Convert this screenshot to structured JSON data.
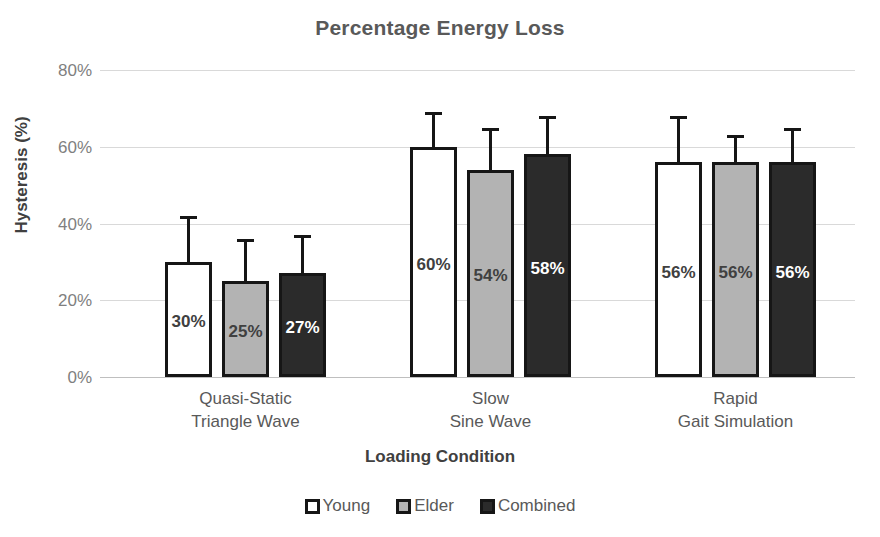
{
  "chart_data": {
    "type": "bar",
    "title": "Percentage Energy Loss",
    "xlabel": "Loading Condition",
    "ylabel": "Hysteresis (%)",
    "ylim": [
      0,
      80
    ],
    "ytick_labels": [
      "80%",
      "60%",
      "40%",
      "20%",
      "0%"
    ],
    "ytick_values": [
      80,
      60,
      40,
      20,
      0
    ],
    "grid": true,
    "legend_position": "bottom",
    "categories": [
      "Quasi-Static\nTriangle Wave",
      "Slow\nSine Wave",
      "Rapid\nGait Simulation"
    ],
    "category_lines": [
      [
        "Quasi-Static",
        "Triangle Wave"
      ],
      [
        "Slow",
        "Sine Wave"
      ],
      [
        "Rapid",
        "Gait Simulation"
      ]
    ],
    "series": [
      {
        "name": "Young",
        "color": "#ffffff",
        "values": [
          30,
          60,
          56
        ],
        "errors": [
          12,
          9,
          12
        ],
        "labels": [
          "30%",
          "60%",
          "56%"
        ]
      },
      {
        "name": "Elder",
        "color": "#b3b3b3",
        "values": [
          25,
          54,
          56
        ],
        "errors": [
          11,
          11,
          7
        ],
        "labels": [
          "25%",
          "54%",
          "56%"
        ]
      },
      {
        "name": "Combined",
        "color": "#2b2b2b",
        "values": [
          27,
          58,
          56
        ],
        "errors": [
          10,
          10,
          9
        ],
        "labels": [
          "27%",
          "58%",
          "56%"
        ]
      }
    ]
  },
  "legend": {
    "items": [
      {
        "label": "Young",
        "swatch": "young"
      },
      {
        "label": "Elder",
        "swatch": "elder"
      },
      {
        "label": "Combined",
        "swatch": "combined"
      }
    ]
  },
  "colors": {
    "title": "#595959",
    "axis_text": "#7f7f7f",
    "axis_title": "#404040",
    "gridline": "#d9d9d9",
    "bar_outline": "#161616"
  }
}
